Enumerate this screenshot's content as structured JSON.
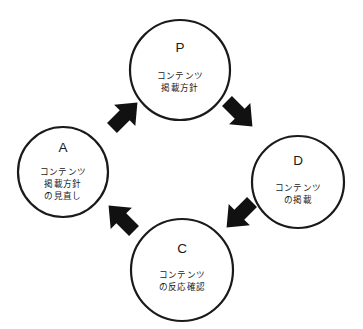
{
  "diagram": {
    "type": "pdca-cycle",
    "title": "",
    "background_color": "#ffffff",
    "stroke_color": "#1a1a1a",
    "arrow_color": "#111111",
    "direction": "clockwise",
    "nodes": [
      {
        "id": "plan",
        "letter": "P",
        "position": "top",
        "cx": 180,
        "cy": 70,
        "r": 50,
        "desc_lines": [
          "コンテンツ",
          "掲載方針"
        ]
      },
      {
        "id": "do",
        "letter": "D",
        "position": "right",
        "cx": 298,
        "cy": 182,
        "r": 46,
        "desc_lines": [
          "コンテンツ",
          "の掲載"
        ]
      },
      {
        "id": "check",
        "letter": "C",
        "position": "bottom",
        "cx": 182,
        "cy": 270,
        "r": 51,
        "desc_lines": [
          "コンテンツ",
          "の反応確認"
        ]
      },
      {
        "id": "act",
        "letter": "A",
        "position": "left",
        "cx": 63,
        "cy": 172,
        "r": 45,
        "desc_lines": [
          "コンテンツ",
          "掲載方針",
          "の見直し"
        ]
      }
    ],
    "arrows": [
      {
        "id": "act-to-plan",
        "from": "act",
        "to": "plan",
        "points_toward": "up-right"
      },
      {
        "id": "plan-to-do",
        "from": "plan",
        "to": "do",
        "points_toward": "down-right"
      },
      {
        "id": "do-to-check",
        "from": "do",
        "to": "check",
        "points_toward": "down-left"
      },
      {
        "id": "check-to-act",
        "from": "check",
        "to": "act",
        "points_toward": "up-left"
      }
    ]
  }
}
